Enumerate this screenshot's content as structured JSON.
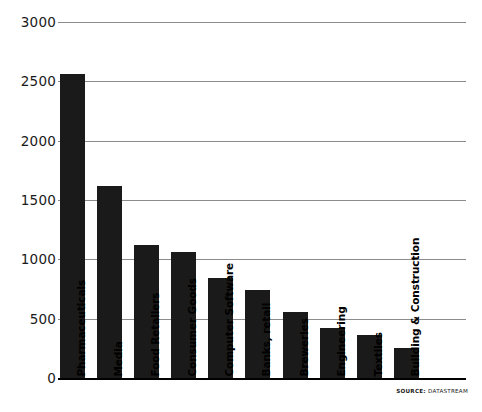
{
  "chart_data": {
    "type": "bar",
    "title": "",
    "subtitle": "",
    "xlabel": "",
    "ylabel": "",
    "ylim": [
      0,
      3000
    ],
    "ytick_step": 500,
    "yticks": [
      0,
      500,
      1000,
      1500,
      2000,
      2500,
      3000
    ],
    "ytick_labels": [
      "0",
      "500",
      "1000",
      "1500",
      "2000",
      "2500",
      "3000"
    ],
    "grid": true,
    "legend": false,
    "orientation": "vertical",
    "bar_color": "#1a1a1a",
    "grid_color": "#8c8c8c",
    "categories": [
      "Pharmaceuticals",
      "Media",
      "Food Retailers",
      "Consumer Goods",
      "Computer Software",
      "Banks, retail",
      "Breweries",
      "Engineering",
      "Textiles",
      "Building & Construction"
    ],
    "values": [
      2560,
      1620,
      1120,
      1060,
      840,
      740,
      560,
      420,
      360,
      250
    ]
  },
  "source": {
    "label": "SOURCE:",
    "value": "DATASTREAM"
  }
}
